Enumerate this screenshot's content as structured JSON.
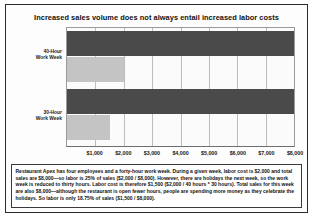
{
  "chart_data": {
    "type": "bar",
    "orientation": "horizontal",
    "title": "Increased sales volume does not always entail increased labor costs",
    "xlabel": "",
    "ylabel": "",
    "categories": [
      "40-Hour Work Week",
      "30-Hour Work Week"
    ],
    "category_labels_multiline": [
      [
        "40-Hour",
        "Work Week"
      ],
      [
        "30-Hour",
        "Work Week"
      ]
    ],
    "series": [
      {
        "name": "Total Sales",
        "values": [
          8000,
          8000
        ],
        "color": "#4a4a4a"
      },
      {
        "name": "Labor Cost",
        "values": [
          2000,
          1500
        ],
        "color": "#c4c4c4"
      }
    ],
    "tick_labels": [
      "$1,000",
      "$2,000",
      "$3,000",
      "$4,000",
      "$5,000",
      "$6,000",
      "$7,000",
      "$8,000"
    ],
    "tick_values": [
      1000,
      2000,
      3000,
      4000,
      5000,
      6000,
      7000,
      8000
    ],
    "xlim": [
      0,
      8000
    ],
    "grid": true,
    "legend": "none",
    "notes": [
      "40-Hour Work Week: sales bar spans full axis to $8,000; labor bar spans to $2,000 (25% of sales)",
      "30-Hour Work Week: sales bar spans full axis to $8,000; labor bar spans to $1,500 (18.75% of sales)"
    ]
  },
  "caption": {
    "text": "Restaurant Apex has four employees and a forty-hour work week. During a given week, labor cost is $2,000 and total sales are $8,000—so labor is 25% of sales ($2,000 / $8,000). However, there are holidays the next week, so the work week is reduced to thirty hours. Labor cost is therefore $1,500 ($2,000 / 40 hours * 30 hours). Total sales for this week are also $8,000—although the restaurant is open fewer hours, people are spending more money as they celebrate the holidays. So labor is only 18.75% of sales ($1,500 / $8,000)."
  },
  "colors": {
    "sales_bar": "#4a4a4a",
    "labor_bar": "#c4c4c4",
    "frame_border": "#2b2b2b",
    "gridline": "#bdbdbd",
    "text": "#111111"
  }
}
